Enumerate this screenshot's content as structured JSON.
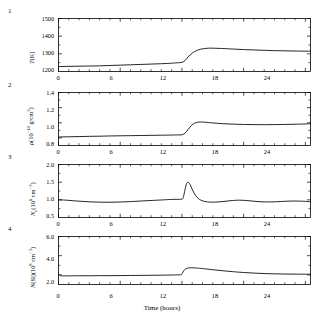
{
  "figure": {
    "top_partial_text": "",
    "xaxis_title": "Time (hours)",
    "panel_numbers": [
      "1",
      "2",
      "3",
      "4"
    ],
    "xticks": [
      "0",
      "6",
      "12",
      "18",
      "24"
    ]
  },
  "panels": [
    {
      "number": "1",
      "ylabel_plain": "T(K)",
      "yticks": [
        "1500",
        "1400",
        "1300",
        "1200"
      ]
    },
    {
      "number": "2",
      "ylabel_plain": "ρ(10⁻¹⁴ g/cm³)",
      "yticks": [
        "1.4",
        "1.2",
        "1.0",
        "0.8"
      ]
    },
    {
      "number": "3",
      "ylabel_plain": "Nₑ(10⁶ cm⁻³)",
      "yticks": [
        "2.0",
        "1.5",
        "1.0",
        "0.5"
      ]
    },
    {
      "number": "4",
      "ylabel_plain": "N(Si)(10⁸ cm⁻³)",
      "yticks": [
        "6.0",
        "4.0",
        "2.0"
      ]
    }
  ],
  "chart_data": [
    {
      "type": "line",
      "title": "",
      "panel": "1",
      "xlabel": "Time (hours)",
      "ylabel": "T(K)",
      "xlim": [
        0,
        24.5
      ],
      "ylim": [
        1200,
        1500
      ],
      "xticks": [
        0,
        6,
        12,
        18,
        24
      ],
      "yticks": [
        1200,
        1300,
        1400,
        1500
      ],
      "grid": false,
      "legend": "none",
      "x": [
        0,
        1,
        2,
        3,
        4,
        5,
        6,
        7,
        8,
        9,
        10,
        11,
        11.5,
        12,
        12.3,
        12.6,
        13,
        13.4,
        13.8,
        14.2,
        14.6,
        15,
        15.5,
        16,
        17,
        18,
        19,
        20,
        21,
        22,
        23,
        24,
        24.5
      ],
      "y": [
        1228,
        1229,
        1230,
        1231,
        1232,
        1234,
        1236,
        1238,
        1240,
        1242,
        1244,
        1247,
        1249,
        1252,
        1262,
        1282,
        1304,
        1318,
        1326,
        1330,
        1332,
        1332,
        1331,
        1330,
        1327,
        1324,
        1322,
        1320,
        1318,
        1317,
        1316,
        1315,
        1315
      ]
    },
    {
      "type": "line",
      "title": "",
      "panel": "2",
      "xlabel": "Time (hours)",
      "ylabel": "ρ(10⁻¹⁴ g/cm³)",
      "xlim": [
        0,
        24.5
      ],
      "ylim": [
        0.7,
        1.4
      ],
      "xticks": [
        0,
        6,
        12,
        18,
        24
      ],
      "yticks": [
        0.8,
        1.0,
        1.2,
        1.4
      ],
      "grid": false,
      "legend": "none",
      "x": [
        0,
        1,
        2,
        3,
        4,
        5,
        6,
        7,
        8,
        9,
        10,
        11,
        11.6,
        12,
        12.3,
        12.6,
        12.9,
        13.2,
        13.5,
        13.8,
        14.2,
        15,
        16,
        17,
        18,
        19,
        20,
        21,
        22,
        23,
        24,
        24.5
      ],
      "y": [
        0.812,
        0.815,
        0.818,
        0.821,
        0.823,
        0.826,
        0.828,
        0.83,
        0.832,
        0.834,
        0.836,
        0.838,
        0.84,
        0.842,
        0.862,
        0.912,
        0.962,
        0.992,
        1.006,
        1.01,
        1.008,
        0.998,
        0.988,
        0.982,
        0.978,
        0.976,
        0.975,
        0.976,
        0.978,
        0.981,
        0.985,
        0.987
      ]
    },
    {
      "type": "line",
      "title": "",
      "panel": "3",
      "xlabel": "Time (hours)",
      "ylabel": "N_e(10^6 cm^-3)",
      "xlim": [
        0,
        24.5
      ],
      "ylim": [
        0.5,
        2.0
      ],
      "xticks": [
        0,
        6,
        12,
        18,
        24
      ],
      "yticks": [
        0.5,
        1.0,
        1.5,
        2.0
      ],
      "grid": false,
      "legend": "none",
      "x": [
        0,
        0.5,
        1,
        2,
        3,
        4,
        5,
        6,
        7,
        8,
        9,
        10,
        10.6,
        11,
        11.5,
        12,
        12.15,
        12.3,
        12.45,
        12.6,
        12.8,
        13,
        13.3,
        13.7,
        14.2,
        14.8,
        15.4,
        16,
        16.6,
        17.2,
        17.6,
        18.2,
        18.8,
        19.4,
        20,
        20.6,
        21.2,
        21.8,
        22.4,
        23,
        23.6,
        24,
        24.5
      ],
      "y": [
        1.0,
        0.995,
        0.985,
        0.962,
        0.944,
        0.934,
        0.932,
        0.938,
        0.95,
        0.966,
        0.982,
        0.996,
        1.006,
        1.012,
        1.014,
        1.02,
        1.09,
        1.29,
        1.46,
        1.5,
        1.43,
        1.3,
        1.13,
        1.012,
        0.955,
        0.935,
        0.938,
        0.952,
        0.972,
        0.986,
        0.99,
        0.982,
        0.966,
        0.95,
        0.942,
        0.94,
        0.946,
        0.956,
        0.964,
        0.966,
        0.962,
        0.956,
        0.948
      ]
    },
    {
      "type": "line",
      "title": "",
      "panel": "4",
      "xlabel": "Time (hours)",
      "ylabel": "N(Si)(10^8 cm^-3)",
      "xlim": [
        0,
        24.5
      ],
      "ylim": [
        1.0,
        6.0
      ],
      "xticks": [
        0,
        6,
        12,
        18,
        24
      ],
      "yticks": [
        2.0,
        4.0,
        6.0
      ],
      "grid": false,
      "legend": "none",
      "x": [
        0,
        0.15,
        0.4,
        1,
        2,
        3,
        4,
        5,
        6,
        7,
        8,
        9,
        10,
        11,
        11.7,
        11.95,
        12.1,
        12.3,
        12.55,
        12.8,
        13.1,
        13.5,
        14,
        15,
        16,
        17,
        18,
        19,
        20,
        21,
        22,
        23,
        24,
        24.5
      ],
      "y": [
        2.12,
        1.93,
        1.9,
        1.9,
        1.91,
        1.91,
        1.92,
        1.92,
        1.93,
        1.94,
        1.95,
        1.96,
        1.97,
        1.99,
        2.01,
        2.03,
        2.3,
        2.58,
        2.7,
        2.74,
        2.74,
        2.71,
        2.66,
        2.54,
        2.43,
        2.33,
        2.25,
        2.19,
        2.14,
        2.11,
        2.09,
        2.08,
        2.07,
        2.07
      ]
    }
  ]
}
